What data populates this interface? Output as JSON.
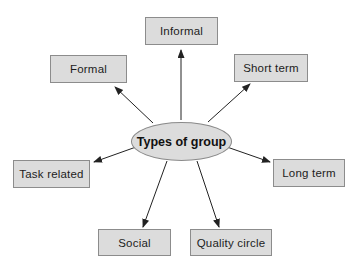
{
  "diagram": {
    "center": {
      "label": "Types of group"
    },
    "nodes": [
      {
        "id": "informal",
        "label": "Informal"
      },
      {
        "id": "formal",
        "label": "Formal"
      },
      {
        "id": "short-term",
        "label": "Short term"
      },
      {
        "id": "task-related",
        "label": "Task related"
      },
      {
        "id": "long-term",
        "label": "Long term"
      },
      {
        "id": "social",
        "label": "Social"
      },
      {
        "id": "quality-circle",
        "label": "Quality circle"
      }
    ],
    "edges": [
      {
        "from": "center",
        "to": "informal"
      },
      {
        "from": "center",
        "to": "formal"
      },
      {
        "from": "center",
        "to": "short-term"
      },
      {
        "from": "center",
        "to": "task-related"
      },
      {
        "from": "center",
        "to": "long-term"
      },
      {
        "from": "center",
        "to": "social"
      },
      {
        "from": "center",
        "to": "quality-circle"
      }
    ],
    "colors": {
      "node_fill": "#dcdcdc",
      "node_border": "#8c8c8c",
      "arrow": "#222222",
      "background": "#ffffff"
    }
  }
}
